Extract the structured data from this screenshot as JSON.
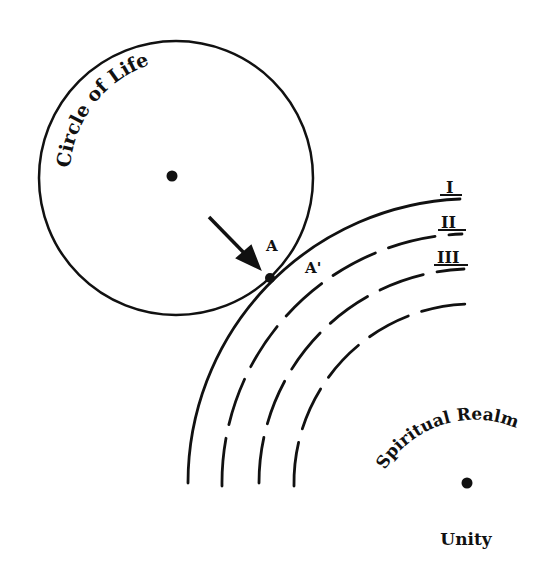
{
  "diagram": {
    "circle_of_life": {
      "label": "Circle of Life",
      "center": [
        176,
        178
      ],
      "radius": 137
    },
    "contact_point": {
      "label_a": "A",
      "label_a_prime": "A'",
      "position": [
        270,
        278
      ]
    },
    "arrow": {
      "from": [
        209,
        217
      ],
      "to": [
        260,
        269
      ]
    },
    "spiritual_realm": {
      "label": "Spiritual Realm",
      "center_label": "Unity",
      "center": [
        467,
        483
      ],
      "levels": [
        {
          "label": "I",
          "radius": 284,
          "style": "solid"
        },
        {
          "label": "II",
          "radius": 249,
          "style": "dashed"
        },
        {
          "label": "III",
          "radius": 214,
          "style": "dashed"
        },
        {
          "label": "",
          "radius": 179,
          "style": "dashed"
        }
      ]
    },
    "colors": {
      "ink": "#111111",
      "background": "#ffffff"
    }
  }
}
